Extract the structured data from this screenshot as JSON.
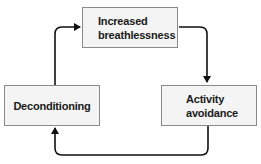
{
  "diagram": {
    "type": "cycle",
    "nodes": [
      {
        "id": "top",
        "lines": [
          "Increased",
          "breathlessness"
        ]
      },
      {
        "id": "right",
        "lines": [
          "Activity",
          "avoidance"
        ]
      },
      {
        "id": "left",
        "lines": [
          "Deconditioning"
        ]
      }
    ],
    "edges": [
      {
        "from": "Increased breathlessness",
        "to": "Activity avoidance"
      },
      {
        "from": "Activity avoidance",
        "to": "Deconditioning"
      },
      {
        "from": "Deconditioning",
        "to": "Increased breathlessness"
      }
    ],
    "colors": {
      "box_fill": "#f4f4f4",
      "box_border": "#8a8a8a",
      "arrow": "#111111",
      "text": "#1a1a1a"
    }
  }
}
